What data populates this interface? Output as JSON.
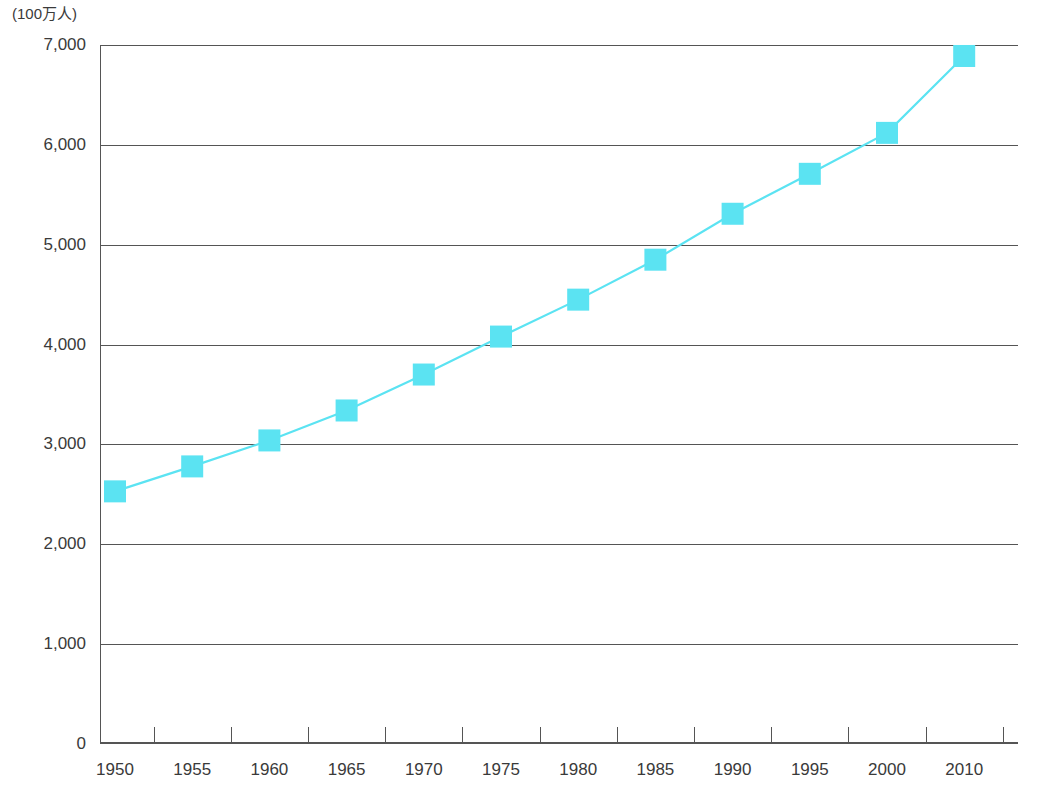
{
  "chart_data": {
    "type": "line",
    "title": "",
    "subtitle": "",
    "xlabel": "",
    "ylabel": "(100万人)",
    "y_unit_label": "(100万人)",
    "categories": [
      "1950",
      "1955",
      "1960",
      "1965",
      "1970",
      "1975",
      "1980",
      "1985",
      "1990",
      "1995",
      "2000",
      "2010"
    ],
    "x": [
      1950,
      1955,
      1960,
      1965,
      1970,
      1975,
      1980,
      1985,
      1990,
      1995,
      2000,
      2010
    ],
    "values": [
      2530,
      2780,
      3040,
      3340,
      3700,
      4080,
      4450,
      4850,
      5310,
      5710,
      6120,
      6890
    ],
    "series": [
      {
        "name": "世界人口",
        "values": [
          2530,
          2780,
          3040,
          3340,
          3700,
          4080,
          4450,
          4850,
          5310,
          5710,
          6120,
          6890
        ],
        "color": "#5BE3F2",
        "marker": "square"
      }
    ],
    "ylim": [
      0,
      7000
    ],
    "ytick_labels": [
      "0",
      "1,000",
      "2,000",
      "3,000",
      "4,000",
      "5,000",
      "6,000",
      "7,000"
    ],
    "ytick_values": [
      0,
      1000,
      2000,
      3000,
      4000,
      5000,
      6000,
      7000
    ],
    "xtick_labels": [
      "1950",
      "1955",
      "1960",
      "1965",
      "1970",
      "1975",
      "1980",
      "1985",
      "1990",
      "1995",
      "2000",
      "2010"
    ],
    "grid": "horizontal",
    "legend": "none",
    "line_color": "#5BE3F2",
    "marker_color": "#5BE3F2",
    "axis_color": "#555555"
  },
  "axis": {
    "y_unit": "(100万人)"
  }
}
